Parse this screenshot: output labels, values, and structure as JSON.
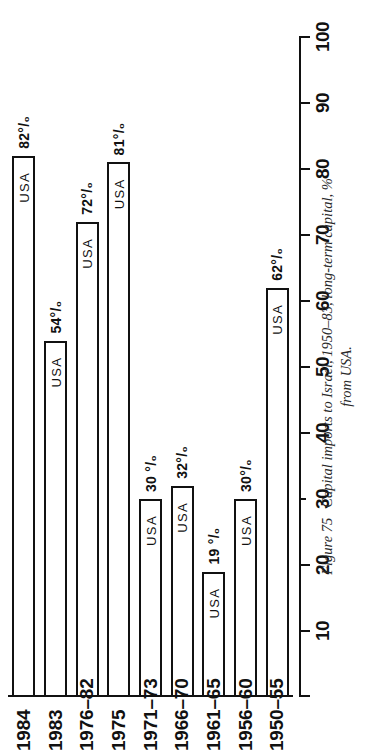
{
  "figure": {
    "caption_number": "Figure 75",
    "caption_line1": "Capital imports to Israel, 1950–83, long-term capital, %",
    "caption_line2": "from USA."
  },
  "chart_data": {
    "type": "bar",
    "orientation": "vertical",
    "title": "Capital imports to Israel, 1950–83, long-term capital, % from USA.",
    "xlabel": "",
    "ylabel": "",
    "ylim": [
      0,
      100
    ],
    "grid": false,
    "legend": null,
    "categories": [
      "1950–55",
      "1956–60",
      "1961–65",
      "1966–70",
      "1971–73",
      "1975",
      "1976–82",
      "1983",
      "1984"
    ],
    "series": [
      {
        "name": "USA",
        "values": [
          62,
          30,
          19,
          32,
          30,
          81,
          72,
          54,
          82
        ]
      }
    ],
    "data_labels": [
      "62°/₀",
      "30°/₀",
      "19 °/₀",
      "32°/₀",
      "30 °/₀",
      "81°/₀",
      "72°/₀",
      "54°/₀",
      "82°/₀"
    ],
    "bar_labels": [
      "USA",
      "USA",
      "USA",
      "USA",
      "USA",
      "USA",
      "USA",
      "USA",
      "USA"
    ],
    "yticks": [
      100,
      90,
      80,
      70,
      60,
      50,
      40,
      30,
      20,
      10
    ],
    "ytick_labels": [
      "100",
      "90",
      "80",
      "70",
      "60",
      "50",
      "40",
      "30",
      "20",
      "10"
    ]
  }
}
